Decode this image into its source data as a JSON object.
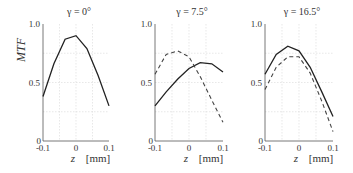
{
  "chart_data": [
    {
      "type": "line",
      "title": "γ = 0°",
      "xlabel": "z [mm]",
      "ylabel": "MTF",
      "x": [
        -0.1,
        -0.067,
        -0.033,
        0,
        0.033,
        0.067,
        0.1
      ],
      "xlim": [
        -0.1,
        0.1
      ],
      "ylim": [
        0,
        1.0
      ],
      "xticks": [
        "-0.1",
        "0",
        "0.1"
      ],
      "yticks": [
        "0",
        "0.5",
        "1.0"
      ],
      "grid": true,
      "series": [
        {
          "name": "solid",
          "style": "solid",
          "values": [
            0.38,
            0.66,
            0.87,
            0.9,
            0.79,
            0.56,
            0.3
          ]
        }
      ]
    },
    {
      "type": "line",
      "title": "γ = 7.5°",
      "xlabel": "z [mm]",
      "ylabel": "",
      "x": [
        -0.1,
        -0.067,
        -0.033,
        0,
        0.033,
        0.067,
        0.1
      ],
      "xlim": [
        -0.1,
        0.1
      ],
      "ylim": [
        0,
        1.0
      ],
      "xticks": [
        "-0.1",
        "0",
        "0.1"
      ],
      "yticks": [
        "0",
        "0.5",
        "1.0"
      ],
      "grid": true,
      "series": [
        {
          "name": "solid",
          "style": "solid",
          "values": [
            0.3,
            0.42,
            0.53,
            0.62,
            0.67,
            0.66,
            0.59
          ]
        },
        {
          "name": "dashed",
          "style": "dashed",
          "values": [
            0.57,
            0.74,
            0.77,
            0.72,
            0.55,
            0.35,
            0.16
          ]
        }
      ]
    },
    {
      "type": "line",
      "title": "γ = 16.5°",
      "xlabel": "z [mm]",
      "ylabel": "",
      "x": [
        -0.1,
        -0.067,
        -0.033,
        0,
        0.033,
        0.067,
        0.1
      ],
      "xlim": [
        -0.1,
        0.1
      ],
      "ylim": [
        0,
        1.0
      ],
      "xticks": [
        "-0.1",
        "0",
        "0.1"
      ],
      "yticks": [
        "0",
        "0.5",
        "1.0"
      ],
      "grid": true,
      "series": [
        {
          "name": "solid",
          "style": "solid",
          "values": [
            0.57,
            0.74,
            0.81,
            0.77,
            0.63,
            0.42,
            0.21
          ]
        },
        {
          "name": "dashed",
          "style": "dashed",
          "values": [
            0.44,
            0.63,
            0.72,
            0.72,
            0.58,
            0.34,
            0.08
          ]
        }
      ]
    }
  ],
  "labels": {
    "ylabel": "MTF",
    "titles": [
      "γ = 0°",
      "γ = 7.5°",
      "γ = 16.5°"
    ],
    "xlabel_var": "z",
    "xlabel_unit": "[mm]"
  }
}
